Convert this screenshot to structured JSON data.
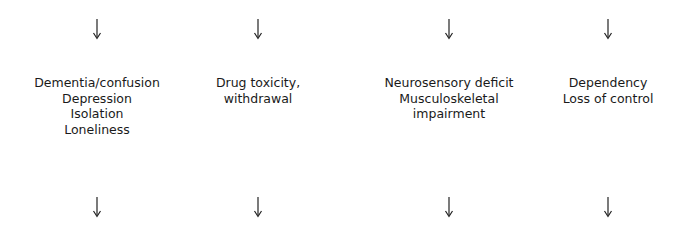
{
  "diagram": {
    "columns": [
      {
        "id": "cognitive",
        "lines": [
          "Dementia/confusion",
          "Depression",
          "Isolation",
          "Loneliness"
        ]
      },
      {
        "id": "drug",
        "lines": [
          "Drug toxicity,",
          "withdrawal"
        ]
      },
      {
        "id": "physical",
        "lines": [
          "Neurosensory deficit",
          "Musculoskeletal",
          "impairment"
        ]
      },
      {
        "id": "psychosocial",
        "lines": [
          "Dependency",
          "Loss of control"
        ]
      }
    ],
    "arrow_icon": "down-arrow-icon",
    "colors": {
      "text": "#1a1a1a",
      "arrow": "#222222",
      "background": "#ffffff"
    }
  }
}
